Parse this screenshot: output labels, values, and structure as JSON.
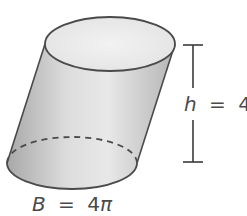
{
  "figure": {
    "shape": "oblique cylinder",
    "height_label": {
      "variable": "h",
      "operator": "=",
      "value": "4"
    },
    "base_label": {
      "variable": "B",
      "operator": "=",
      "value": "4",
      "symbol": "π"
    },
    "colors": {
      "stroke": "#4a4a4a",
      "body_light": "#ececec",
      "body_dark": "#a9a9a9",
      "top_face": "#eeeeee"
    }
  }
}
